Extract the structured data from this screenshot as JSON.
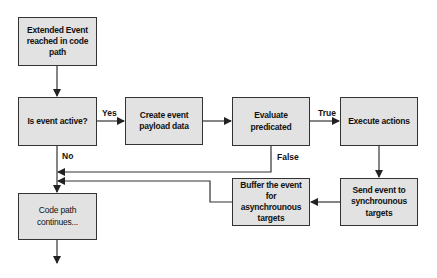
{
  "diagram": {
    "nodes": [
      {
        "id": "start",
        "label": "Extended Event reached in code path"
      },
      {
        "id": "active",
        "label": "Is event active?"
      },
      {
        "id": "payload",
        "label": "Create event payload data"
      },
      {
        "id": "evaluate",
        "label": "Evaluate predicated"
      },
      {
        "id": "execute",
        "label": "Execute actions"
      },
      {
        "id": "send",
        "label": "Send event to synchrounous targets"
      },
      {
        "id": "buffer",
        "label": "Buffer the event for asynchrounous targets"
      },
      {
        "id": "continue",
        "label": "Code path continues..."
      }
    ],
    "edge_labels": {
      "yes": "Yes",
      "no": "No",
      "true": "True",
      "false": "False"
    },
    "edges": [
      {
        "from": "start",
        "to": "active"
      },
      {
        "from": "active",
        "to": "payload",
        "label": "Yes"
      },
      {
        "from": "active",
        "to": "continue",
        "label": "No"
      },
      {
        "from": "payload",
        "to": "evaluate"
      },
      {
        "from": "evaluate",
        "to": "execute",
        "label": "True"
      },
      {
        "from": "evaluate",
        "to": "continue",
        "label": "False"
      },
      {
        "from": "execute",
        "to": "send"
      },
      {
        "from": "send",
        "to": "buffer"
      },
      {
        "from": "buffer",
        "to": "continue"
      }
    ],
    "colors": {
      "box_fill": "#e2e2e2",
      "border": "#333333",
      "line": "#333333"
    }
  }
}
